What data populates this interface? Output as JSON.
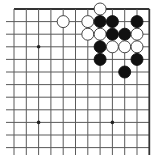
{
  "board": {
    "view": "top-right corner of 19x19 Go board",
    "columns_visible": 12,
    "rows_visible": 12,
    "col_x": [
      14,
      26.3,
      38.6,
      50.9,
      63.2,
      75.5,
      87.8,
      100.1,
      112.4,
      124.7,
      137,
      149.3
    ],
    "row_y": [
      9,
      21.6,
      34.2,
      46.8,
      59.4,
      72,
      84.6,
      97.2,
      109.8,
      122.4,
      135,
      147.6
    ],
    "edges": [
      "top",
      "right"
    ],
    "line_color": "#5a5a5a",
    "edge_line_color": "#333333",
    "stone_radius": 6,
    "colors": {
      "black_stone": "#111111",
      "white_stone": "#ffffff",
      "white_stone_outline": "#333333",
      "star_point": "#222222"
    },
    "star_points": [
      {
        "col": 2,
        "row": 3
      },
      {
        "col": 8,
        "row": 3
      },
      {
        "col": 2,
        "row": 9
      },
      {
        "col": 8,
        "row": 9
      }
    ],
    "stones": [
      {
        "color": "white",
        "col": 7,
        "row": 0
      },
      {
        "color": "white",
        "col": 4,
        "row": 1
      },
      {
        "color": "white",
        "col": 6,
        "row": 1
      },
      {
        "color": "black",
        "col": 7,
        "row": 1
      },
      {
        "color": "black",
        "col": 8,
        "row": 1
      },
      {
        "color": "black",
        "col": 10,
        "row": 1
      },
      {
        "color": "white",
        "col": 6,
        "row": 2
      },
      {
        "color": "white",
        "col": 7,
        "row": 2
      },
      {
        "color": "black",
        "col": 8,
        "row": 2
      },
      {
        "color": "black",
        "col": 9,
        "row": 2
      },
      {
        "color": "white",
        "col": 10,
        "row": 2
      },
      {
        "color": "black",
        "col": 7,
        "row": 3
      },
      {
        "color": "white",
        "col": 8,
        "row": 3
      },
      {
        "color": "white",
        "col": 9,
        "row": 3
      },
      {
        "color": "white",
        "col": 10,
        "row": 3
      },
      {
        "color": "black",
        "col": 7,
        "row": 4
      },
      {
        "color": "black",
        "col": 10,
        "row": 4
      },
      {
        "color": "black",
        "col": 9,
        "row": 5
      }
    ]
  }
}
